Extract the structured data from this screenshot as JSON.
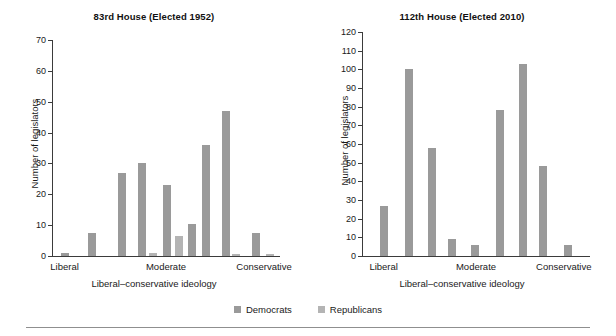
{
  "figure": {
    "legend": {
      "items": [
        {
          "label": "Democrats",
          "color": "#9a9a9a",
          "icon": "square-swatch-icon"
        },
        {
          "label": "Republicans",
          "color": "#b4b4b4",
          "icon": "square-swatch-icon"
        }
      ]
    }
  },
  "chart_data": [
    {
      "type": "bar",
      "title": "83rd House (Elected 1952)",
      "xlabel": "Liberal–conservative ideology",
      "ylabel": "Number of legislators",
      "ylim": [
        0,
        70
      ],
      "yticks": [
        0,
        10,
        20,
        30,
        40,
        50,
        60,
        70
      ],
      "grid": false,
      "legend_position": "bottom-center",
      "xtick_labels": [
        "Liberal",
        "Moderate",
        "Conservative"
      ],
      "xtick_positions": [
        0.055,
        0.5,
        0.93
      ],
      "xlim": [
        0,
        1
      ],
      "series": [
        {
          "name": "Democrats",
          "color": "#9a9a9a",
          "points": [
            {
              "x": 0.055,
              "value": 1
            },
            {
              "x": 0.175,
              "value": 7.5
            },
            {
              "x": 0.305,
              "value": 27
            },
            {
              "x": 0.395,
              "value": 30
            },
            {
              "x": 0.505,
              "value": 23
            },
            {
              "x": 0.615,
              "value": 10.5
            },
            {
              "x": 0.675,
              "value": 36
            },
            {
              "x": 0.765,
              "value": 47
            },
            {
              "x": 0.895,
              "value": 7.5
            }
          ]
        },
        {
          "name": "Republicans",
          "color": "#b4b4b4",
          "points": [
            {
              "x": 0.445,
              "value": 1
            },
            {
              "x": 0.555,
              "value": 6.5
            },
            {
              "x": 0.765,
              "value": 39.5
            },
            {
              "x": 0.805,
              "value": 0.8
            },
            {
              "x": 0.955,
              "value": 0.8
            }
          ]
        }
      ]
    },
    {
      "type": "bar",
      "title": "112th House (Elected 2010)",
      "xlabel": "Liberal–conservative ideology",
      "ylabel": "Number of legislators",
      "ylim": [
        0,
        120
      ],
      "yticks": [
        0,
        10,
        20,
        30,
        40,
        50,
        60,
        70,
        80,
        90,
        100,
        110,
        120
      ],
      "grid": false,
      "legend_position": "bottom-center",
      "xtick_labels": [
        "Liberal",
        "Moderate",
        "Conservative"
      ],
      "xtick_positions": [
        0.095,
        0.5,
        0.885
      ],
      "xlim": [
        0,
        1
      ],
      "series": [
        {
          "name": "Democrats",
          "color": "#9a9a9a",
          "points": [
            {
              "x": 0.095,
              "value": 27
            },
            {
              "x": 0.205,
              "value": 100
            },
            {
              "x": 0.305,
              "value": 58
            },
            {
              "x": 0.395,
              "value": 9
            },
            {
              "x": 0.495,
              "value": 6
            },
            {
              "x": 0.605,
              "value": 78
            },
            {
              "x": 0.705,
              "value": 103
            },
            {
              "x": 0.795,
              "value": 48
            },
            {
              "x": 0.905,
              "value": 6
            }
          ]
        },
        {
          "name": "Republicans",
          "color": "#b4b4b4",
          "points": [
            {
              "x": 0.605,
              "value": 67
            },
            {
              "x": 0.705,
              "value": 67
            }
          ]
        }
      ]
    }
  ]
}
